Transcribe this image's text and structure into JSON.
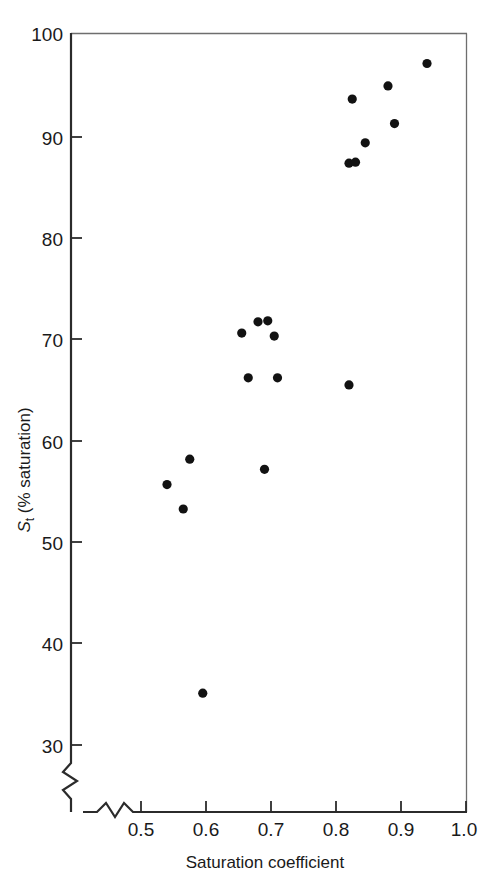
{
  "chart_data": {
    "type": "scatter",
    "title": "",
    "xlabel": "Saturation coefficient",
    "ylabel": "S_t (% saturation)",
    "ylabel_parts": {
      "symbol": "S",
      "subscript": "t",
      "rest": " (% saturation)"
    },
    "xlim": [
      0.46,
      1.0
    ],
    "ylim": [
      27.5,
      100
    ],
    "xticks": [
      0.5,
      0.6,
      0.7,
      0.8,
      0.9,
      1.0
    ],
    "xtick_labels": [
      "0.5",
      "0.6",
      "0.7",
      "0.8",
      "0.9",
      "1.0"
    ],
    "yticks": [
      30,
      40,
      50,
      60,
      70,
      80,
      90,
      100
    ],
    "ytick_labels": [
      "30",
      "40",
      "50",
      "60",
      "70",
      "80",
      "90",
      "100"
    ],
    "grid": false,
    "legend": null,
    "axis_break": {
      "x_axis": true,
      "y_axis": true,
      "style": "zigzag"
    },
    "marker": {
      "shape": "circle",
      "color": "#121212",
      "radius_px": 4.6
    },
    "points": [
      {
        "x": 0.54,
        "y": 55.6
      },
      {
        "x": 0.575,
        "y": 58.1
      },
      {
        "x": 0.565,
        "y": 53.2
      },
      {
        "x": 0.595,
        "y": 35.1
      },
      {
        "x": 0.655,
        "y": 70.5
      },
      {
        "x": 0.665,
        "y": 66.1
      },
      {
        "x": 0.68,
        "y": 71.6
      },
      {
        "x": 0.695,
        "y": 71.7
      },
      {
        "x": 0.69,
        "y": 57.1
      },
      {
        "x": 0.705,
        "y": 70.2
      },
      {
        "x": 0.71,
        "y": 66.1
      },
      {
        "x": 0.82,
        "y": 65.4
      },
      {
        "x": 0.82,
        "y": 87.2
      },
      {
        "x": 0.825,
        "y": 93.5
      },
      {
        "x": 0.83,
        "y": 87.3
      },
      {
        "x": 0.845,
        "y": 89.2
      },
      {
        "x": 0.88,
        "y": 94.8
      },
      {
        "x": 0.89,
        "y": 91.1
      },
      {
        "x": 0.94,
        "y": 97.0
      }
    ]
  },
  "colors": {
    "marker": "#121212",
    "axis": "#2b2b2b",
    "frame": "#6e6e6e",
    "text": "#1a1a1a",
    "background": "#ffffff"
  }
}
